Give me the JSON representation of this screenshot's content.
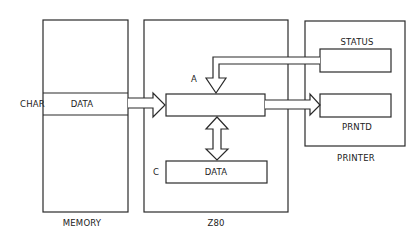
{
  "diagram": {
    "colors": {
      "stroke": "#2a2a2a",
      "background": "#ffffff",
      "text": "#222222"
    },
    "blocks": {
      "memory": {
        "label": "MEMORY",
        "row_label": "DATA",
        "row_pointer": "CHAR"
      },
      "z80": {
        "label": "Z80",
        "register_a": "A",
        "register_c": "C",
        "register_c_content": "DATA"
      },
      "printer": {
        "label": "PRINTER",
        "status_port": "STATUS",
        "data_port": "PRNTD"
      }
    },
    "connections": [
      {
        "from": "memory.DATA",
        "to": "z80.A",
        "type": "single-arrow"
      },
      {
        "from": "z80.A",
        "to": "printer.PRNTD",
        "type": "single-arrow"
      },
      {
        "from": "printer.STATUS",
        "to": "z80.A",
        "type": "single-arrow"
      },
      {
        "from": "z80.A",
        "to": "z80.C",
        "type": "double-arrow"
      }
    ]
  }
}
